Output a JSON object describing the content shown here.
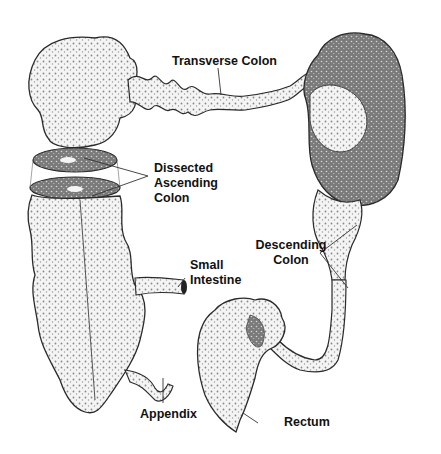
{
  "diagram": {
    "style": "grayscale stippled illustration",
    "colors": {
      "background": "#ffffff",
      "tissue_light": "#f2f2f2",
      "tissue_mid": "#bdbdbd",
      "tissue_dark": "#6e6e6e",
      "outline": "#2a2a2a",
      "label_text": "#111111",
      "leader_line": "#333333"
    },
    "labels": {
      "transverse_colon": "Transverse Colon",
      "dissected_ascending_colon": [
        "Dissected",
        "Ascending",
        "Colon"
      ],
      "small_intestine": [
        "Small",
        "Intestine"
      ],
      "descending_colon": [
        "Descending",
        "Colon"
      ],
      "appendix": "Appendix",
      "rectum": "Rectum"
    }
  }
}
